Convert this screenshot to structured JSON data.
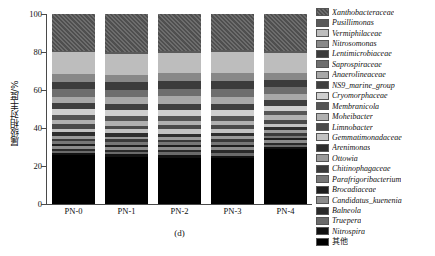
{
  "chart_data": {
    "type": "bar",
    "title": "",
    "caption": "(d)",
    "xlabel": "",
    "ylabel": "属级相对丰度/%",
    "ylim": [
      0,
      100
    ],
    "yticks": [
      0,
      20,
      40,
      60,
      80,
      100
    ],
    "grid": false,
    "stacked": true,
    "legend_position": "right",
    "categories": [
      "PN-0",
      "PN-1",
      "PN-2",
      "PN-3",
      "PN-4"
    ],
    "series": [
      {
        "name": "其他",
        "color": "#000000",
        "pattern": "solid",
        "values": [
          26.0,
          25.0,
          24.5,
          24.0,
          29.0
        ]
      },
      {
        "name": "Nitrospira",
        "color": "#111111",
        "pattern": "solid",
        "values": [
          1.2,
          1.4,
          1.6,
          1.5,
          1.3
        ]
      },
      {
        "name": "Truepera",
        "color": "#6a6a6a",
        "pattern": "solid",
        "values": [
          1.0,
          1.1,
          1.2,
          1.3,
          1.1
        ]
      },
      {
        "name": "Balneola",
        "color": "#2a2a2a",
        "pattern": "solid",
        "values": [
          1.1,
          1.0,
          1.2,
          1.4,
          1.0
        ]
      },
      {
        "name": "Candidatus_kuenenia",
        "color": "#8c8c8c",
        "pattern": "solid",
        "values": [
          1.3,
          1.5,
          1.4,
          1.6,
          1.2
        ]
      },
      {
        "name": "Brocadiaceae",
        "color": "#1e1e1e",
        "pattern": "solid",
        "values": [
          1.2,
          1.3,
          1.5,
          1.4,
          1.3
        ]
      },
      {
        "name": "Parafrigoribacterium",
        "color": "#777777",
        "pattern": "solid",
        "values": [
          1.4,
          1.2,
          1.3,
          1.5,
          1.2
        ]
      },
      {
        "name": "Chitinophagaceae",
        "color": "#3a3a3a",
        "pattern": "solid",
        "values": [
          1.5,
          1.6,
          1.4,
          1.3,
          1.5
        ]
      },
      {
        "name": "Ottowia",
        "color": "#9a9a9a",
        "pattern": "solid",
        "values": [
          1.6,
          1.4,
          1.5,
          1.7,
          1.4
        ]
      },
      {
        "name": "Arenimonas",
        "color": "#2e2e2e",
        "pattern": "solid",
        "values": [
          1.8,
          1.7,
          1.6,
          1.5,
          1.6
        ]
      },
      {
        "name": "Gemmatimonadaceae",
        "color": "#c2c2c2",
        "pattern": "solid",
        "values": [
          2.0,
          2.2,
          2.4,
          2.1,
          1.9
        ]
      },
      {
        "name": "Limnobacter",
        "color": "#4a4a4a",
        "pattern": "solid",
        "values": [
          2.2,
          2.0,
          2.1,
          2.3,
          2.0
        ]
      },
      {
        "name": "Moheibacter",
        "color": "#b0b0b0",
        "pattern": "solid",
        "values": [
          2.4,
          2.6,
          2.3,
          2.2,
          2.4
        ]
      },
      {
        "name": "Membranicola",
        "color": "#555555",
        "pattern": "solid",
        "values": [
          2.6,
          2.4,
          2.5,
          2.7,
          2.3
        ]
      },
      {
        "name": "Cryomorphaceae",
        "color": "#cfcfcf",
        "pattern": "solid",
        "values": [
          3.0,
          3.2,
          3.4,
          3.1,
          2.8
        ]
      },
      {
        "name": "NS9_marine_group",
        "color": "#3f3f3f",
        "pattern": "solid",
        "values": [
          3.2,
          3.0,
          3.1,
          3.3,
          2.9
        ]
      },
      {
        "name": "Anaerolineaceae",
        "color": "#a8a8a8",
        "pattern": "solid",
        "values": [
          3.6,
          3.8,
          4.0,
          3.7,
          3.4
        ]
      },
      {
        "name": "Saprospiraceae",
        "color": "#6e6e6e",
        "pattern": "solid",
        "values": [
          3.8,
          3.6,
          3.7,
          3.9,
          3.5
        ]
      },
      {
        "name": "Lentimicrobiaceae",
        "color": "#3c3c3c",
        "pattern": "solid",
        "values": [
          4.0,
          4.2,
          4.4,
          4.1,
          3.8
        ]
      },
      {
        "name": "Nitrosomonas",
        "color": "#888888",
        "pattern": "solid",
        "values": [
          4.2,
          4.0,
          4.1,
          4.3,
          3.9
        ]
      },
      {
        "name": "Vermiphilaceae",
        "color": "#bdbdbd",
        "pattern": "solid",
        "values": [
          11.4,
          11.0,
          10.8,
          11.3,
          10.3
        ]
      },
      {
        "name": "Pusillimonas",
        "color": "#5a5a5a",
        "pattern": "solid",
        "values": [
          1.0,
          1.2,
          1.1,
          1.0,
          1.1
        ]
      },
      {
        "name": "Xanthobacteraceae",
        "color": "#4f4f4f",
        "pattern": "hatch",
        "values": [
          19.4,
          19.9,
          19.4,
          18.8,
          19.6
        ]
      }
    ]
  },
  "legend": {
    "items": [
      {
        "label": "Xanthobacteraceae",
        "color": "#4f4f4f",
        "pattern": "hatch"
      },
      {
        "label": "Pusillimonas",
        "color": "#5a5a5a",
        "pattern": "solid"
      },
      {
        "label": "Vermiphilaceae",
        "color": "#bdbdbd",
        "pattern": "solid"
      },
      {
        "label": "Nitrosomonas",
        "color": "#888888",
        "pattern": "solid"
      },
      {
        "label": "Lentimicrobiaceae",
        "color": "#3c3c3c",
        "pattern": "solid"
      },
      {
        "label": "Saprospiraceae",
        "color": "#6e6e6e",
        "pattern": "solid"
      },
      {
        "label": "Anaerolineaceae",
        "color": "#a8a8a8",
        "pattern": "solid"
      },
      {
        "label": "NS9_marine_group",
        "color": "#3f3f3f",
        "pattern": "solid"
      },
      {
        "label": "Cryomorphaceae",
        "color": "#cfcfcf",
        "pattern": "solid"
      },
      {
        "label": "Membranicola",
        "color": "#555555",
        "pattern": "solid"
      },
      {
        "label": "Moheibacter",
        "color": "#b0b0b0",
        "pattern": "solid"
      },
      {
        "label": "Limnobacter",
        "color": "#4a4a4a",
        "pattern": "solid"
      },
      {
        "label": "Gemmatimonadaceae",
        "color": "#c2c2c2",
        "pattern": "solid"
      },
      {
        "label": "Arenimonas",
        "color": "#2e2e2e",
        "pattern": "solid"
      },
      {
        "label": "Ottowia",
        "color": "#9a9a9a",
        "pattern": "solid"
      },
      {
        "label": "Chitinophagaceae",
        "color": "#3a3a3a",
        "pattern": "solid"
      },
      {
        "label": "Parafrigoribacterium",
        "color": "#777777",
        "pattern": "solid"
      },
      {
        "label": "Brocadiaceae",
        "color": "#1e1e1e",
        "pattern": "solid"
      },
      {
        "label": "Candidatus_kuenenia",
        "color": "#8c8c8c",
        "pattern": "solid"
      },
      {
        "label": "Balneola",
        "color": "#2a2a2a",
        "pattern": "solid"
      },
      {
        "label": "Truepera",
        "color": "#6a6a6a",
        "pattern": "solid"
      },
      {
        "label": "Nitrospira",
        "color": "#111111",
        "pattern": "solid"
      },
      {
        "label": "其他",
        "color": "#000000",
        "pattern": "solid"
      }
    ]
  }
}
